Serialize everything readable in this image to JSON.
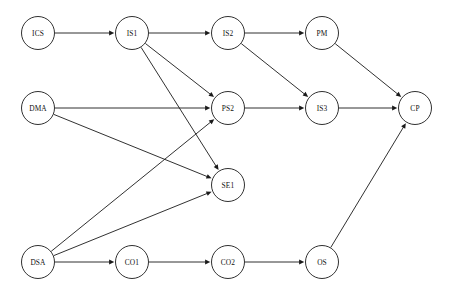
{
  "diagram": {
    "title": "",
    "type": "directed-graph",
    "background_color": "#ffffff",
    "node_fill_color": "#ffffff",
    "node_stroke_color": "#1a1a1a",
    "edge_color": "#1a1a1a",
    "label_color": "#111111",
    "node_radius": 16.5,
    "nodes": [
      {
        "id": "ICS",
        "label": "ICS",
        "x": 38,
        "y": 33
      },
      {
        "id": "IS1",
        "label": "IS1",
        "x": 132,
        "y": 33
      },
      {
        "id": "IS2",
        "label": "IS2",
        "x": 228,
        "y": 33
      },
      {
        "id": "PM",
        "label": "PM",
        "x": 322,
        "y": 33
      },
      {
        "id": "DMA",
        "label": "DMA",
        "x": 38,
        "y": 108
      },
      {
        "id": "PS2",
        "label": "PS2",
        "x": 228,
        "y": 108
      },
      {
        "id": "IS3",
        "label": "IS3",
        "x": 322,
        "y": 108
      },
      {
        "id": "CP",
        "label": "CP",
        "x": 415,
        "y": 108
      },
      {
        "id": "SE1",
        "label": "SE1",
        "x": 228,
        "y": 185
      },
      {
        "id": "DSA",
        "label": "DSA",
        "x": 38,
        "y": 262
      },
      {
        "id": "CO1",
        "label": "CO1",
        "x": 132,
        "y": 262
      },
      {
        "id": "CO2",
        "label": "CO2",
        "x": 228,
        "y": 262
      },
      {
        "id": "OS",
        "label": "OS",
        "x": 322,
        "y": 262
      }
    ],
    "edges": [
      {
        "from": "ICS",
        "to": "IS1"
      },
      {
        "from": "IS1",
        "to": "IS2"
      },
      {
        "from": "IS1",
        "to": "PS2"
      },
      {
        "from": "IS1",
        "to": "SE1"
      },
      {
        "from": "IS2",
        "to": "PM"
      },
      {
        "from": "IS2",
        "to": "IS3"
      },
      {
        "from": "PM",
        "to": "CP"
      },
      {
        "from": "DMA",
        "to": "PS2"
      },
      {
        "from": "DMA",
        "to": "SE1"
      },
      {
        "from": "PS2",
        "to": "IS3"
      },
      {
        "from": "IS3",
        "to": "CP"
      },
      {
        "from": "DSA",
        "to": "PS2"
      },
      {
        "from": "DSA",
        "to": "SE1"
      },
      {
        "from": "DSA",
        "to": "CO1"
      },
      {
        "from": "CO1",
        "to": "CO2"
      },
      {
        "from": "CO2",
        "to": "OS"
      },
      {
        "from": "OS",
        "to": "CP"
      }
    ]
  }
}
